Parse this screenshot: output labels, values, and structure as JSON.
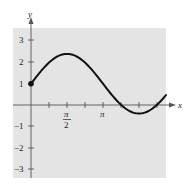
{
  "chart_data": {
    "type": "line",
    "title": "",
    "xlabel": "x",
    "ylabel": "y",
    "function": "y = 1 + 1.4 sin x (approx.)",
    "x_ticks": [
      {
        "value": 0.7854,
        "label": ""
      },
      {
        "value": 1.5708,
        "label": "π/2"
      },
      {
        "value": 2.3562,
        "label": ""
      },
      {
        "value": 3.1416,
        "label": "π"
      },
      {
        "value": 3.927,
        "label": ""
      },
      {
        "value": 4.7124,
        "label": ""
      },
      {
        "value": 5.4978,
        "label": ""
      }
    ],
    "y_ticks": [
      -3,
      -2,
      -1,
      1,
      2,
      3
    ],
    "xlim": [
      -1.0,
      7.4
    ],
    "ylim": [
      -3.4,
      3.6
    ],
    "grid": false,
    "background": "#e6e6e6",
    "start_point": {
      "x": 0,
      "y": 1,
      "marker": "filled-circle"
    },
    "series": [
      {
        "name": "curve",
        "x": [
          0,
          0.3927,
          0.7854,
          1.1781,
          1.5708,
          1.9635,
          2.3562,
          2.7489,
          3.1416,
          3.5343,
          3.927,
          4.3197,
          4.7124,
          5.1051,
          5.4978,
          5.8905,
          6.2832
        ],
        "values": [
          1.0,
          1.54,
          1.99,
          2.29,
          2.4,
          2.29,
          1.99,
          1.54,
          1.0,
          0.46,
          0.01,
          -0.29,
          -0.4,
          -0.29,
          0.01,
          0.46,
          1.0
        ]
      }
    ]
  },
  "labels": {
    "x_axis": "x",
    "y_axis": "y",
    "y3": "3",
    "y2": "2",
    "y1": "1",
    "ym1": "−1",
    "ym2": "−2",
    "ym3": "−3",
    "pi_over_2_num": "π",
    "pi_over_2_den": "2",
    "pi": "π"
  }
}
